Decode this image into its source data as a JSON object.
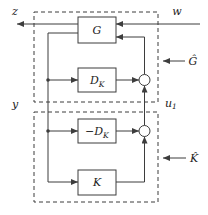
{
  "diagram": {
    "colors": {
      "line": "#3d3d3d",
      "text": "#222222",
      "background": "#ffffff"
    },
    "blocks": {
      "g": "G",
      "dk_base": "D",
      "dk_sub": "K",
      "neg_dk_minus": "−",
      "neg_dk_base": "D",
      "neg_dk_sub": "K",
      "k": "K"
    },
    "labels": {
      "z": "z",
      "w": "w",
      "y": "y",
      "u1_base": "u",
      "u1_sub": "1",
      "g_hat": "Ĝ",
      "k_hat": "K̂"
    }
  }
}
